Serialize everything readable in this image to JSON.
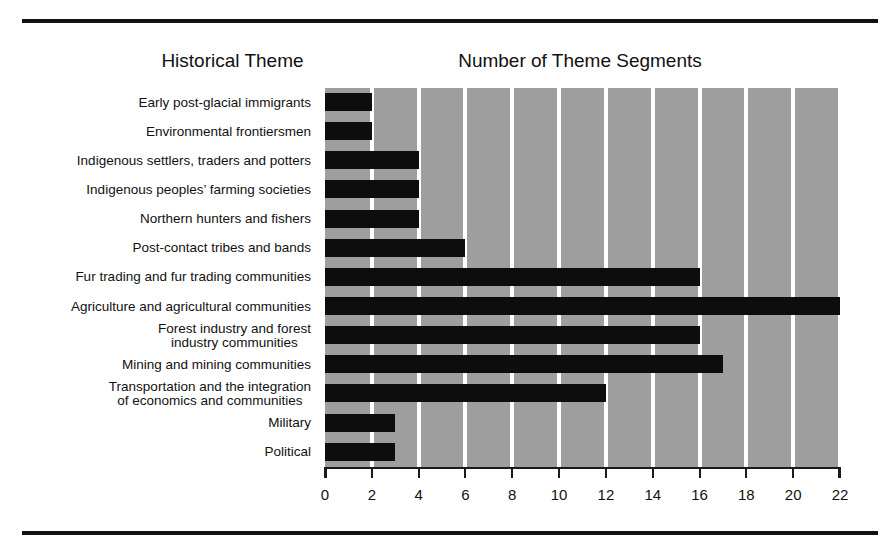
{
  "headers": {
    "theme_column": "Historical Theme",
    "count_column": "Number of Theme Segments"
  },
  "colors": {
    "plot_background": "#9e9e9e",
    "gridline": "#ffffff",
    "bar": "#0d0d0d",
    "axis": "#1a1a1a",
    "rule": "#111111",
    "text": "#111111",
    "page_background": "#ffffff"
  },
  "chart_data": {
    "type": "bar",
    "orientation": "horizontal",
    "title": "",
    "subtitle": "",
    "xlabel": "Number of Theme Segments",
    "ylabel": "Historical Theme",
    "xlim": [
      0,
      22
    ],
    "xticks": [
      0,
      2,
      4,
      6,
      8,
      10,
      12,
      14,
      16,
      18,
      20,
      22
    ],
    "xtick_labels": [
      "0",
      "2",
      "4",
      "6",
      "8",
      "10",
      "12",
      "14",
      "16",
      "18",
      "20",
      "22"
    ],
    "grid": "vertical-only",
    "legend": "none",
    "categories": [
      "Early post-glacial immigrants",
      "Environmental frontiersmen",
      "Indigenous settlers, traders and potters",
      "Indigenous peoples’ farming societies",
      "Northern hunters and fishers",
      "Post-contact tribes and bands",
      "Fur trading and fur trading communities",
      "Agriculture and agricultural communities",
      "Forest industry and forest industry communities",
      "Mining and mining communities",
      "Transportation and the integration of economics and communities",
      "Military",
      "Political"
    ],
    "category_lines": [
      [
        "Early post-glacial immigrants"
      ],
      [
        "Environmental frontiersmen"
      ],
      [
        "Indigenous settlers, traders and potters"
      ],
      [
        "Indigenous peoples’ farming societies"
      ],
      [
        "Northern hunters and fishers"
      ],
      [
        "Post-contact tribes and bands"
      ],
      [
        "Fur trading and fur trading communities"
      ],
      [
        "Agriculture and agricultural communities"
      ],
      [
        "Forest industry and forest",
        "industry communities"
      ],
      [
        "Mining and mining communities"
      ],
      [
        "Transportation and the integration",
        "of economics and communities"
      ],
      [
        "Military"
      ],
      [
        "Political"
      ]
    ],
    "values": [
      2,
      2,
      4,
      4,
      4,
      6,
      16,
      22,
      16,
      17,
      12,
      3,
      3
    ]
  }
}
